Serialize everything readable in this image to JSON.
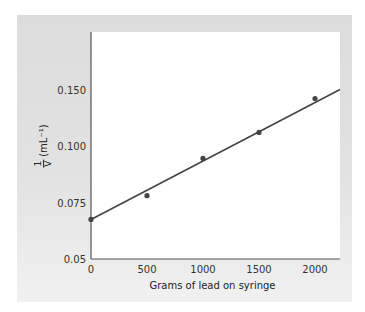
{
  "chart_data": {
    "type": "scatter",
    "title": "",
    "xlabel": "Grams of lead on syringe",
    "ylabel": "1/V (mL⁻¹)",
    "ylabel_fraction": {
      "numerator": "1",
      "denominator": "V",
      "units": "(mL⁻¹)"
    },
    "x_ticks": [
      0,
      500,
      1000,
      1500,
      2000
    ],
    "y_tick_labels": [
      "0.05",
      "0.075",
      "0.100",
      "0.150"
    ],
    "xlim": [
      0,
      2250
    ],
    "ylim": [
      0.05,
      0.15
    ],
    "grid": false,
    "legend": null,
    "series": [
      {
        "name": "data points",
        "x": [
          0,
          500,
          1000,
          1500,
          2000
        ],
        "y": [
          0.0675,
          0.078,
          0.0945,
          0.106,
          0.121
        ]
      }
    ],
    "fit_line": {
      "type": "linear",
      "x": [
        0,
        2250
      ],
      "y": [
        0.0675,
        0.125
      ]
    }
  },
  "axis": {
    "x_tick_labels": [
      "0",
      "500",
      "1000",
      "1500",
      "2000"
    ],
    "y_tick_labels": [
      "0.150",
      "0.100",
      "0.075",
      "0.05"
    ]
  },
  "labels": {
    "xlabel": "Grams of lead on syringe",
    "ylabel_num": "1",
    "ylabel_den": "V",
    "ylabel_units": "(mL⁻¹)"
  },
  "colors": {
    "line": "#444444",
    "points": "#444444",
    "panel": "#e0e0e0",
    "plot_bg": "#ffffff"
  }
}
